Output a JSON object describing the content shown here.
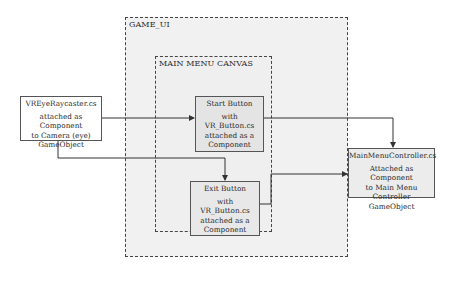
{
  "diagram": {
    "regions": {
      "game_ui": {
        "label": "GAME_UI"
      },
      "main_menu_canvas": {
        "label": "MAIN MENU CANVAS"
      }
    },
    "nodes": {
      "vreye": {
        "title": "VREyeRaycaster.cs",
        "lines": [
          "attached as Component",
          "to Camera (eye)",
          "GameObject"
        ]
      },
      "start_button": {
        "title": "Start Button",
        "lines": [
          "with VR_Button.cs",
          "attached as a",
          "Component"
        ]
      },
      "exit_button": {
        "title": "Exit Button",
        "lines": [
          "with VR_Button.cs",
          "attached as a",
          "Component"
        ]
      },
      "main_menu_controller": {
        "title": "MainMenuController.cs",
        "lines": [
          "Attached as Component",
          "to Main Menu Controller",
          "GameObject"
        ]
      }
    },
    "edges": [
      {
        "from": "VREyeRaycaster.cs",
        "to": "Start Button"
      },
      {
        "from": "VREyeRaycaster.cs",
        "to": "Exit Button"
      },
      {
        "from": "Start Button",
        "to": "MainMenuController.cs"
      },
      {
        "from": "Exit Button",
        "to": "MainMenuController.cs"
      }
    ],
    "colors": {
      "line": "#333333",
      "region_fill": "#f1f1f1",
      "box_border": "#555555"
    }
  }
}
